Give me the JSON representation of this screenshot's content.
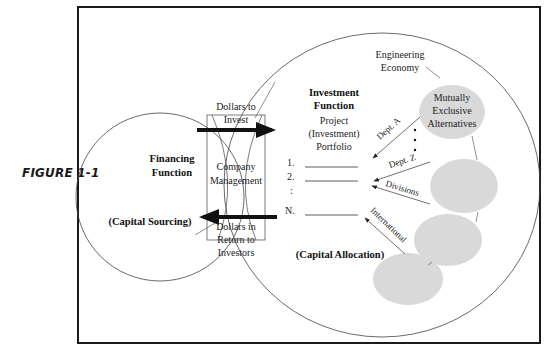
{
  "figure": {
    "caption": "FIGURE 1-1"
  },
  "financing": {
    "title_line1": "Financing",
    "title_line2": "Function",
    "subtitle": "(Capital Sourcing)"
  },
  "management": {
    "line1": "Company",
    "line2": "Management",
    "to_invest_line1": "Dollars to",
    "to_invest_line2": "Invest",
    "return_line1": "Dollars in",
    "return_line2": "Return to",
    "return_line3": "Investors"
  },
  "investment": {
    "title_line1": "Investment",
    "title_line2": "Function",
    "portfolio_line1": "Project",
    "portfolio_line2": "(Investment)",
    "portfolio_line3": "Portfolio",
    "items": [
      "1.",
      "2.",
      ":",
      "N."
    ],
    "subtitle": "(Capital Allocation)"
  },
  "alternatives": {
    "engineering_line1": "Engineering",
    "engineering_line2": "Economy",
    "mutually_line1": "Mutually",
    "mutually_line2": "Exclusive",
    "mutually_line3": "Alternatives",
    "sources": [
      "Dept. A",
      "Dept. Z",
      "Divisions",
      "International"
    ]
  },
  "colors": {
    "frame": "#1a1a1a",
    "ellipse_fill": "#d9d9d9",
    "line": "#333333"
  }
}
